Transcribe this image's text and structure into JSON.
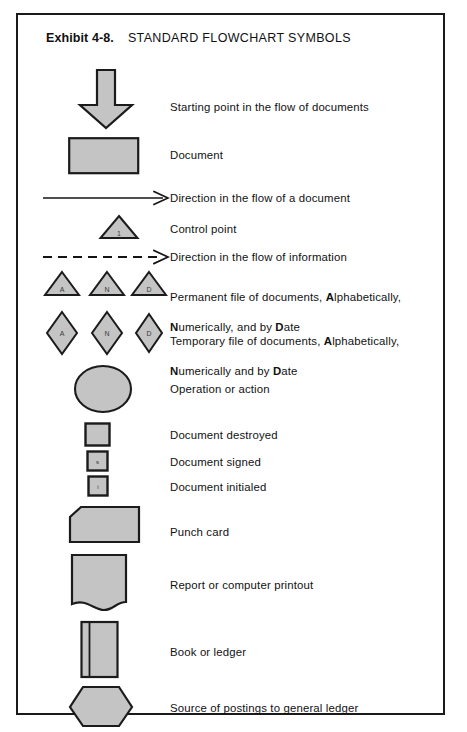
{
  "exhibit": {
    "number_label": "Exhibit 4-8.",
    "title": "STANDARD FLOWCHART SYMBOLS",
    "border_color": "#1a1a1a",
    "symbol_fill": "#c4c4c4",
    "symbol_stroke": "#1b1b1b",
    "background": "#ffffff"
  },
  "rows": [
    {
      "id": "starting-point",
      "symbol": "down-block-arrow",
      "label": "Starting point in the flow of documents",
      "label_top": 85
    },
    {
      "id": "document",
      "symbol": "rectangle",
      "label": "Document",
      "label_top": 133
    },
    {
      "id": "document-flow-direction",
      "symbol": "solid-arrow-right",
      "label": "Direction in the flow of a document",
      "label_top": 176
    },
    {
      "id": "control-point",
      "symbol": "triangle-numbered",
      "glyph": "1",
      "label": "Control point",
      "label_top": 207
    },
    {
      "id": "information-flow-direction",
      "symbol": "dashed-arrow-right",
      "label": "Direction in the flow of information",
      "label_top": 235
    },
    {
      "id": "permanent-file",
      "symbol": "triangle-trio",
      "glyphs": [
        "A",
        "N",
        "D"
      ],
      "label_line1_pre": "Permanent file of documents, ",
      "label_line1_bold": "A",
      "label_line1_post": "lphabetically,",
      "label_line2_bold": "N",
      "label_line2_mid": "umerically, and by ",
      "label_line2_bold2": "D",
      "label_line2_post": "ate",
      "label_top": 260
    },
    {
      "id": "temporary-file",
      "symbol": "diamond-trio",
      "glyphs": [
        "A",
        "N",
        "D"
      ],
      "label_line1_pre": "Temporary file of documents, ",
      "label_line1_bold": "A",
      "label_line1_post": "lphabetically,",
      "label_line2_bold": "N",
      "label_line2_mid": "umerically and by ",
      "label_line2_bold2": "D",
      "label_line2_post": "ate",
      "label_top": 304
    },
    {
      "id": "operation-or-action",
      "symbol": "circle",
      "label": "Operation or action",
      "label_top": 367
    },
    {
      "id": "document-destroyed",
      "symbol": "small-square",
      "label": "Document destroyed",
      "label_top": 413
    },
    {
      "id": "document-signed",
      "symbol": "small-square-signed",
      "glyph": "s",
      "label": "Document signed",
      "label_top": 440
    },
    {
      "id": "document-initialed",
      "symbol": "small-square-initialed",
      "glyph": "i",
      "label": "Document initialed",
      "label_top": 465
    },
    {
      "id": "punch-card",
      "symbol": "punch-card",
      "label": "Punch card",
      "label_top": 510
    },
    {
      "id": "report-printout",
      "symbol": "wavy-document",
      "label": "Report or computer printout",
      "label_top": 563
    },
    {
      "id": "book-or-ledger",
      "symbol": "book",
      "label": "Book or ledger",
      "label_top": 630
    },
    {
      "id": "source-of-postings",
      "symbol": "hexagon",
      "label": "Source of postings to general ledger",
      "label_top": 686
    }
  ]
}
